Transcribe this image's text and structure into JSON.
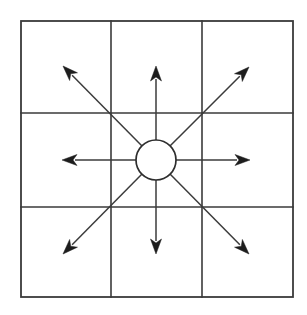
{
  "diagram": {
    "kind": "vector-diagram",
    "canvas": {
      "width": 307,
      "height": 315,
      "background": "#ffffff"
    },
    "colors": {
      "grid_stroke": "#3a3a3a",
      "frame_stroke": "#3a3a3a",
      "circle_stroke": "#2e2e2e",
      "circle_fill": "#ffffff",
      "arrow_stroke": "#3b3b3b",
      "arrow_head_fill": "#1d1d1d"
    },
    "grid": {
      "label": "3x3 grid",
      "rows": 3,
      "columns": 3,
      "frame": {
        "x": 21,
        "y": 21,
        "width": 272,
        "height": 276
      },
      "vertical_line_x": [
        111,
        202
      ],
      "horizontal_line_y": [
        113,
        207
      ]
    },
    "center_node": {
      "label": "center circle",
      "cx": 156,
      "cy": 160,
      "r": 20
    },
    "arrows": [
      {
        "name": "arrow-north",
        "direction": "N",
        "angle_deg": 90,
        "tail": {
          "x": 156,
          "y": 140
        },
        "tip": {
          "x": 156,
          "y": 66
        }
      },
      {
        "name": "arrow-northeast",
        "direction": "NE",
        "angle_deg": 45,
        "tail": {
          "x": 170,
          "y": 146
        },
        "tip": {
          "x": 249,
          "y": 67
        }
      },
      {
        "name": "arrow-east",
        "direction": "E",
        "angle_deg": 0,
        "tail": {
          "x": 176,
          "y": 160
        },
        "tip": {
          "x": 250,
          "y": 160
        }
      },
      {
        "name": "arrow-southeast",
        "direction": "SE",
        "angle_deg": -45,
        "tail": {
          "x": 170,
          "y": 174
        },
        "tip": {
          "x": 249,
          "y": 254
        }
      },
      {
        "name": "arrow-south",
        "direction": "S",
        "angle_deg": -90,
        "tail": {
          "x": 156,
          "y": 180
        },
        "tip": {
          "x": 156,
          "y": 254
        }
      },
      {
        "name": "arrow-southwest",
        "direction": "SW",
        "angle_deg": -135,
        "tail": {
          "x": 142,
          "y": 174
        },
        "tip": {
          "x": 63,
          "y": 254
        }
      },
      {
        "name": "arrow-west",
        "direction": "W",
        "angle_deg": 180,
        "tail": {
          "x": 136,
          "y": 160
        },
        "tip": {
          "x": 62,
          "y": 160
        }
      },
      {
        "name": "arrow-northwest",
        "direction": "NW",
        "angle_deg": 135,
        "tail": {
          "x": 142,
          "y": 146
        },
        "tip": {
          "x": 63,
          "y": 66
        }
      }
    ],
    "arrow_head": {
      "length": 15,
      "half_width": 5.5,
      "notch": 4
    }
  }
}
